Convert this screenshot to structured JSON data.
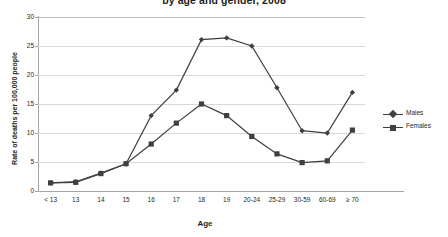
{
  "chart_data": {
    "type": "line",
    "title": "by age and gender, 2008",
    "xlabel": "Age",
    "ylabel": "Rate of deaths per 100,000 people",
    "categories": [
      "< 13",
      "13",
      "14",
      "15",
      "16",
      "17",
      "18",
      "19",
      "20-24",
      "25-29",
      "30-59",
      "60-69",
      "≥ 70"
    ],
    "ylim": [
      0,
      30
    ],
    "yticks": [
      0,
      5,
      10,
      15,
      20,
      25,
      30
    ],
    "grid": true,
    "legend_position": "right",
    "series": [
      {
        "name": "Males",
        "marker": "diamond",
        "color": "#3f3f3f",
        "values": [
          1.4,
          1.6,
          3.1,
          4.7,
          13.0,
          17.4,
          26.1,
          26.4,
          25.0,
          17.8,
          10.4,
          10.0,
          17.0
        ]
      },
      {
        "name": "Females",
        "marker": "square",
        "color": "#3f3f3f",
        "values": [
          1.4,
          1.5,
          3.0,
          4.7,
          8.1,
          11.7,
          15.0,
          13.0,
          9.4,
          6.4,
          4.9,
          5.2,
          10.5
        ]
      }
    ]
  },
  "legend": {
    "items": [
      {
        "label": "Males"
      },
      {
        "label": "Females"
      }
    ]
  }
}
